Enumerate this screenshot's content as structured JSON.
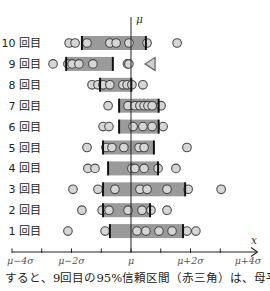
{
  "chart_data": {
    "type": "scatter",
    "title": "",
    "xlabel": "x",
    "ylabel": "",
    "xlim": [
      -4,
      4
    ],
    "grid": false,
    "legend": "none",
    "reference_line": {
      "label": "μ",
      "value": 0
    },
    "x_ticks": [
      -4,
      -3,
      -2,
      -1,
      0,
      1,
      2,
      3,
      4
    ],
    "x_tick_labels": [
      {
        "value": -4,
        "label": "μ−4σ"
      },
      {
        "value": -2,
        "label": "μ−2σ"
      },
      {
        "value": 0,
        "label": "μ"
      },
      {
        "value": 2,
        "label": "μ+2σ"
      },
      {
        "value": 4,
        "label": "μ+4σ"
      }
    ],
    "rows": [
      {
        "trial": 10,
        "label": "10 回目",
        "samples": [
          -2.08,
          -1.88,
          -1.48,
          -0.71,
          -0.5,
          -0.07,
          0.54,
          1.55
        ],
        "ci": [
          -1.65,
          0.5
        ]
      },
      {
        "trial": 9,
        "label": "9 回目",
        "samples": [
          -2.62,
          -2.12,
          -1.98,
          -1.75,
          -1.28,
          -0.12,
          -0.07
        ],
        "ci": [
          -2.18,
          -0.61
        ]
      },
      {
        "trial": 8,
        "label": "8 回目",
        "samples": [
          -1.31,
          -1.11,
          -0.94,
          -0.71,
          -0.27,
          -0.13,
          0.03,
          0.4
        ],
        "ci": [
          -1.04,
          0.01
        ]
      },
      {
        "trial": 7,
        "label": "7 回目",
        "samples": [
          -0.77,
          -0.1,
          0.13,
          0.3,
          0.44,
          0.57,
          0.71,
          1.01
        ],
        "ci": [
          -0.4,
          0.93
        ]
      },
      {
        "trial": 6,
        "label": "6 回目",
        "samples": [
          -0.94,
          -0.74,
          0.07,
          0.4,
          0.71,
          1.08
        ],
        "ci": [
          -0.4,
          0.93
        ]
      },
      {
        "trial": 5,
        "label": "5 回目",
        "samples": [
          -1.48,
          -0.84,
          -0.64,
          -0.24,
          0.27,
          0.44,
          1.88
        ],
        "ci": [
          -0.94,
          0.77
        ]
      },
      {
        "trial": 4,
        "label": "4 回目",
        "samples": [
          -1.45,
          -1.21,
          0.03,
          0.13,
          0.44,
          0.91,
          1.51
        ],
        "ci": [
          -0.77,
          0.91
        ]
      },
      {
        "trial": 3,
        "label": "3 回目",
        "samples": [
          -1.95,
          -1.11,
          -0.54,
          0.3,
          0.54,
          1.21,
          1.92,
          3.03
        ],
        "ci": [
          -0.94,
          1.82
        ]
      },
      {
        "trial": 2,
        "label": "2 回目",
        "samples": [
          -1.65,
          -0.97,
          -0.74,
          -0.1,
          0.37,
          0.67,
          1.21
        ],
        "ci": [
          -0.94,
          0.64
        ]
      },
      {
        "trial": 1,
        "label": "1 回目",
        "samples": [
          -2.12,
          -0.87,
          0.2,
          0.5,
          0.94,
          1.38,
          1.88,
          2.18
        ],
        "ci": [
          -0.71,
          1.75
        ]
      }
    ],
    "marker": {
      "trial": 9,
      "shape": "triangle-left",
      "value": 0.64
    }
  },
  "caption": "すると、9回目の95%信頼区間（赤三角）は、母平",
  "colors": {
    "bar_fill": "#9a9a9a",
    "bar_end": "#111111",
    "point_fill": "#d6d6d6",
    "point_stroke": "#4a4a4a",
    "marker_fill": "#cfcfcf",
    "marker_stroke": "#555555",
    "axis": "#222222",
    "tick_label": "#555555"
  }
}
